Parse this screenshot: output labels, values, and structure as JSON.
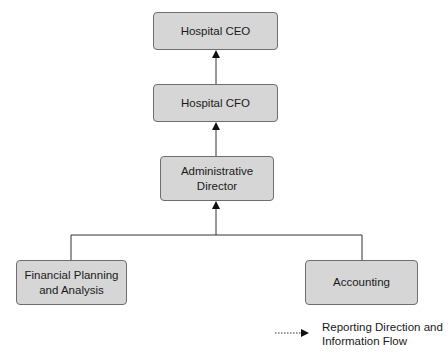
{
  "diagram": {
    "type": "org-chart",
    "nodes": {
      "ceo": "Hospital CEO",
      "cfo": "Hospital CFO",
      "admin": "Administrative Director",
      "fpa": "Financial Planning and Analysis",
      "accounting": "Accounting"
    },
    "edges": [
      {
        "from": "cfo",
        "to": "ceo"
      },
      {
        "from": "admin",
        "to": "cfo"
      },
      {
        "from": "fpa",
        "to": "admin"
      },
      {
        "from": "accounting",
        "to": "admin"
      }
    ],
    "legend": {
      "label": "Reporting Direction and Information Flow"
    },
    "colors": {
      "box_fill": "#d6d6d6",
      "box_border": "#6e6e6e",
      "line": "#333333"
    }
  }
}
